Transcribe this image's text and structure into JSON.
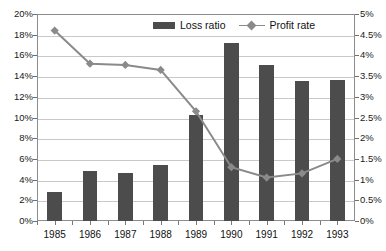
{
  "chart_data": {
    "type": "bar",
    "title": "",
    "subtitle": "",
    "xlabel": "",
    "ylabel": "",
    "categories": [
      "1985",
      "1986",
      "1987",
      "1988",
      "1989",
      "1990",
      "1991",
      "1992",
      "1993"
    ],
    "series": [
      {
        "name": "Loss ratio",
        "type": "bar",
        "axis": "left",
        "color": "#4c4c4c",
        "values": [
          2.8,
          4.8,
          4.6,
          5.4,
          10.2,
          17.2,
          15.1,
          13.5,
          13.6
        ]
      },
      {
        "name": "Profit rate",
        "type": "line",
        "axis": "right",
        "color": "#8a8a8a",
        "marker": "diamond",
        "values": [
          4.6,
          3.8,
          3.77,
          3.65,
          2.65,
          1.3,
          1.05,
          1.15,
          1.5
        ]
      }
    ],
    "left_axis": {
      "label": "",
      "min": 0,
      "max": 20,
      "step": 2,
      "ticks": [
        "0%",
        "2%",
        "4%",
        "6%",
        "8%",
        "10%",
        "12%",
        "14%",
        "16%",
        "18%",
        "20%"
      ]
    },
    "right_axis": {
      "label": "",
      "min": 0,
      "max": 5,
      "step": 0.5,
      "ticks": [
        "0%",
        "0.5%",
        "1%",
        "1.5%",
        "2%",
        "2.5%",
        "3%",
        "3.5%",
        "4%",
        "4.5%",
        "5%"
      ]
    },
    "grid": true,
    "legend": {
      "position": "top-center",
      "entries": [
        {
          "label": "Loss ratio",
          "marker": "bar-swatch",
          "color": "#4c4c4c"
        },
        {
          "label": "Profit rate",
          "marker": "line-diamond",
          "color": "#8a8a8a"
        }
      ]
    }
  }
}
